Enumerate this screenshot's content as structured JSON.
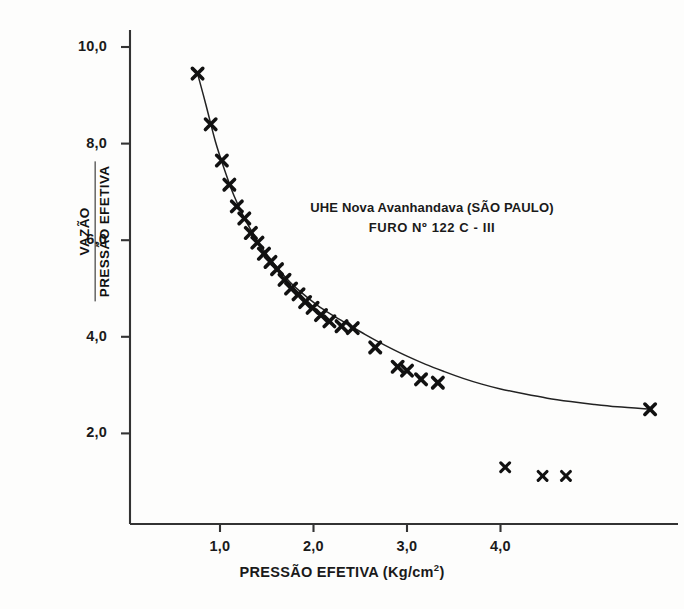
{
  "chart_data": {
    "type": "scatter",
    "title": "",
    "annotation_lines": [
      "UHE Nova Avanhandava  (SÃO PAULO)",
      "FURO  Nº 122  C - III"
    ],
    "xlabel": "PRESSÃO EFETIVA (Kg/cm",
    "xlabel_sup": "2",
    "xlabel_suffix": ")",
    "ylabel_numerator": "VAZÃO",
    "ylabel_denominator": "PRESSÃO EFETIVA",
    "xlim": [
      0.0,
      5.9
    ],
    "ylim": [
      0.55,
      10.6
    ],
    "xticks": [
      1.0,
      2.0,
      3.0,
      4.0
    ],
    "xtick_labels": [
      "1,0",
      "2,0",
      "3,0",
      "4,0"
    ],
    "yticks": [
      2.0,
      4.0,
      6.0,
      8.0,
      10.0
    ],
    "ytick_labels": [
      "2,0",
      "4,0",
      "6,0",
      "8,0",
      "10,0"
    ],
    "grid": false,
    "legend": "none",
    "marker": "x",
    "marker_color": "#111111",
    "curve_color": "#222222",
    "axis_color": "#333333",
    "series": [
      {
        "name": "pontos sobre a curva",
        "points": [
          [
            0.76,
            9.45
          ],
          [
            0.9,
            8.4
          ],
          [
            1.02,
            7.65
          ],
          [
            1.1,
            7.15
          ],
          [
            1.18,
            6.7
          ],
          [
            1.26,
            6.45
          ],
          [
            1.33,
            6.15
          ],
          [
            1.4,
            5.95
          ],
          [
            1.47,
            5.72
          ],
          [
            1.54,
            5.55
          ],
          [
            1.61,
            5.4
          ],
          [
            1.69,
            5.18
          ],
          [
            1.76,
            5.0
          ],
          [
            1.84,
            4.88
          ],
          [
            1.91,
            4.72
          ],
          [
            1.99,
            4.6
          ],
          [
            2.08,
            4.45
          ],
          [
            2.17,
            4.32
          ],
          [
            2.3,
            4.22
          ],
          [
            2.42,
            4.18
          ],
          [
            2.66,
            3.78
          ],
          [
            2.9,
            3.38
          ],
          [
            3.0,
            3.3
          ],
          [
            3.15,
            3.12
          ],
          [
            3.33,
            3.05
          ],
          [
            5.6,
            2.5
          ]
        ]
      },
      {
        "name": "pontos dispersos inferiores",
        "points": [
          [
            4.05,
            1.3
          ],
          [
            4.45,
            1.12
          ],
          [
            4.7,
            1.12
          ]
        ]
      }
    ],
    "fitted_curve": {
      "name": "curva ajustada",
      "points": [
        [
          0.76,
          9.45
        ],
        [
          0.85,
          8.8
        ],
        [
          0.95,
          8.05
        ],
        [
          1.05,
          7.45
        ],
        [
          1.15,
          6.92
        ],
        [
          1.25,
          6.5
        ],
        [
          1.35,
          6.15
        ],
        [
          1.45,
          5.84
        ],
        [
          1.55,
          5.58
        ],
        [
          1.65,
          5.34
        ],
        [
          1.75,
          5.13
        ],
        [
          1.85,
          4.95
        ],
        [
          1.95,
          4.79
        ],
        [
          2.05,
          4.64
        ],
        [
          2.15,
          4.51
        ],
        [
          2.25,
          4.39
        ],
        [
          2.4,
          4.22
        ],
        [
          2.55,
          4.05
        ],
        [
          2.7,
          3.89
        ],
        [
          2.85,
          3.74
        ],
        [
          3.0,
          3.6
        ],
        [
          3.2,
          3.43
        ],
        [
          3.4,
          3.28
        ],
        [
          3.6,
          3.14
        ],
        [
          3.8,
          3.02
        ],
        [
          4.0,
          2.92
        ],
        [
          4.25,
          2.82
        ],
        [
          4.5,
          2.73
        ],
        [
          4.75,
          2.66
        ],
        [
          5.0,
          2.6
        ],
        [
          5.25,
          2.55
        ],
        [
          5.6,
          2.5
        ]
      ]
    }
  }
}
